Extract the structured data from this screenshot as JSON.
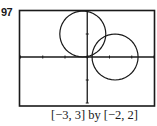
{
  "problem": {
    "number": "97"
  },
  "caption": "[−3, 3] by [−2, 2]",
  "chart_data": {
    "type": "line",
    "title": "",
    "xlabel": "",
    "ylabel": "",
    "xlim": [
      -3,
      3
    ],
    "ylim": [
      -2,
      2
    ],
    "xscale": 1,
    "yscale": 1,
    "grid": false,
    "axes_visible": true,
    "window_label": "[−3, 3] by [−2, 2]",
    "series": [
      {
        "name": "circle-1",
        "shape": "circle",
        "center": [
          -0.2,
          1.0
        ],
        "radius": 1.0
      },
      {
        "name": "circle-2",
        "shape": "circle",
        "center": [
          1.25,
          0.0
        ],
        "radius": 1.0
      }
    ],
    "x_ticks": [
      -3,
      -2,
      -1,
      0,
      1,
      2,
      3
    ],
    "y_ticks": [
      -2,
      -1,
      0,
      1,
      2
    ]
  },
  "colors": {
    "ink": "#1a1a1a",
    "background": "#ffffff"
  }
}
